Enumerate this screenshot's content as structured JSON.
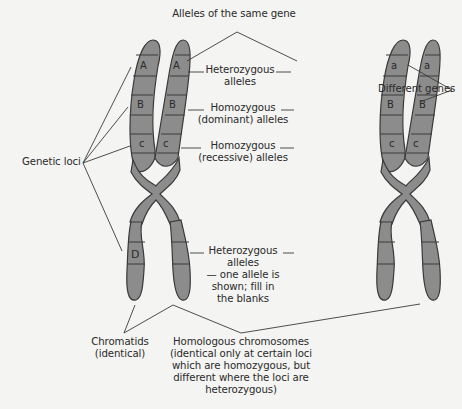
{
  "colors": {
    "background": "#f4f4f2",
    "chromosome_fill": "#8c8c8c",
    "outline": "#3a3a3a",
    "text": "#2a2a2a"
  },
  "labels": {
    "alleles_same_gene": "Alleles of the same gene",
    "different_genes": "Different genes",
    "genetic_loci": "Genetic loci",
    "heterozygous_top_1": "Heterozygous",
    "heterozygous_top_2": "alleles",
    "homozygous_dom_1": "Homozygous",
    "homozygous_dom_2": "(dominant) alleles",
    "homozygous_rec_1": "Homozygous",
    "homozygous_rec_2": "(recessive) alleles",
    "heterozygous_blank_1": "Heterozygous",
    "heterozygous_blank_2": "alleles",
    "heterozygous_blank_3": "— one allele is",
    "heterozygous_blank_4": "shown; fill in",
    "heterozygous_blank_5": "the blanks",
    "chromatids_1": "Chromatids",
    "chromatids_2": "(identical)",
    "homologous_1": "Homologous chromosomes",
    "homologous_2": "(identical only at certain loci",
    "homologous_3": "which are homozygous, but",
    "homologous_4": "different where the loci are",
    "homologous_5": "heterozygous)"
  },
  "chromosomes": [
    {
      "name": "left-chromosome",
      "loci": {
        "A1": "A",
        "A2": "A",
        "B1": "B",
        "B2": "B",
        "c1": "c",
        "c2": "c",
        "D1": "D",
        "D2": ""
      }
    },
    {
      "name": "right-chromosome",
      "loci": {
        "A1": "a",
        "A2": "a",
        "B1": "B",
        "B2": "B",
        "c1": "c",
        "c2": "c",
        "D1": "",
        "D2": ""
      }
    }
  ]
}
